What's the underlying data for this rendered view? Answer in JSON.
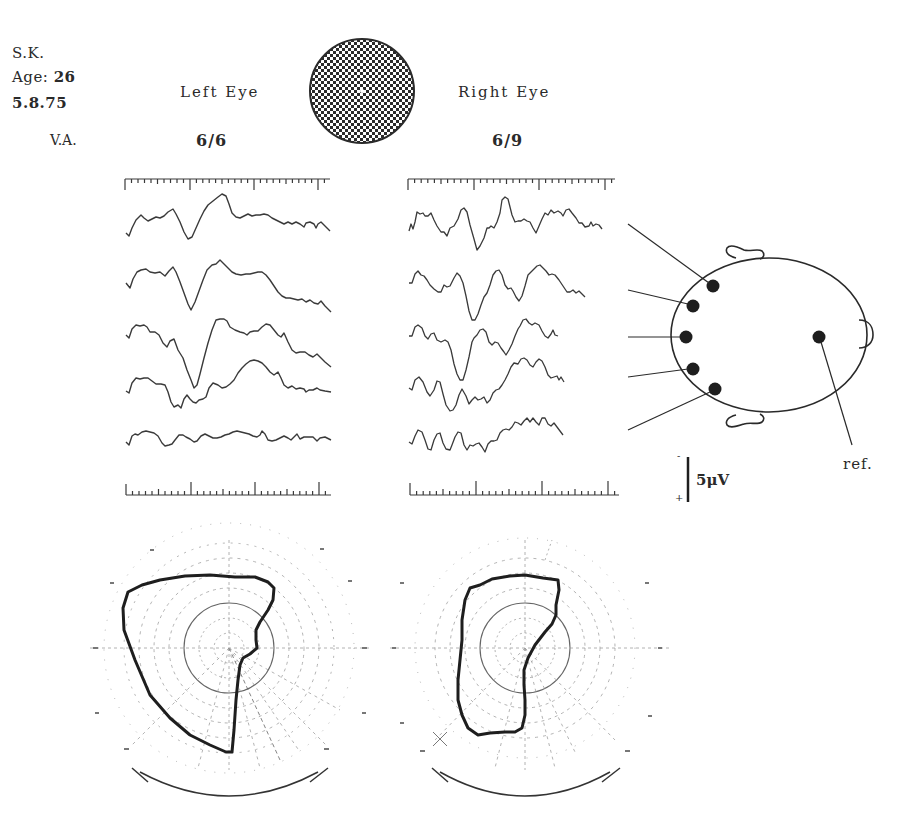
{
  "patient": {
    "initials": "S.K.",
    "age_label": "Age:",
    "age_value": "26",
    "date": "5.8.75",
    "va_label": "V.A."
  },
  "stimulus": {
    "type": "checkerboard-disc",
    "fixation_dot": true
  },
  "left_eye": {
    "title": "Left Eye",
    "visual_acuity": "6/6",
    "trace_count": 5
  },
  "right_eye": {
    "title": "Right Eye",
    "visual_acuity": "6/9",
    "trace_count": 5
  },
  "electrode_map": {
    "active_electrodes": 5,
    "reference_label": "ref."
  },
  "calibration": {
    "amplitude_label": "5μV",
    "minus_sign": "-",
    "plus_sign": "+"
  },
  "visual_fields": [
    {
      "eye": "left",
      "description": "Goldmann perimetry chart with plotted isopter (left eye)"
    },
    {
      "eye": "right",
      "description": "Goldmann perimetry chart with plotted isopter (right eye)"
    }
  ],
  "colors": {
    "ink": "#2a2a2a",
    "trace": "#3a3a3a",
    "grid": "#9a9a9a",
    "background": "#ffffff"
  }
}
